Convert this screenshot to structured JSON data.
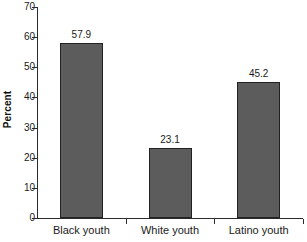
{
  "chart_data": {
    "type": "bar",
    "title": "",
    "subtitle": "",
    "xlabel": "",
    "ylabel": "Percent",
    "categories": [
      "Black youth",
      "White youth",
      "Latino youth"
    ],
    "values": [
      57.9,
      23.1,
      45.2
    ],
    "value_labels": [
      "57.9",
      "23.1",
      "45.2"
    ],
    "ylim": [
      0,
      70
    ],
    "ytick_labels": [
      "0",
      "10",
      "20",
      "30",
      "40",
      "50",
      "60",
      "70"
    ],
    "ytick_values": [
      0,
      10,
      20,
      30,
      40,
      50,
      60,
      70
    ],
    "grid": false,
    "legend": null,
    "legend_position": "none",
    "bar_color": "#5c5c5c",
    "bar_border_color": "#222222",
    "axis_color": "#2b2b2b",
    "background_color": "#ffffff"
  }
}
